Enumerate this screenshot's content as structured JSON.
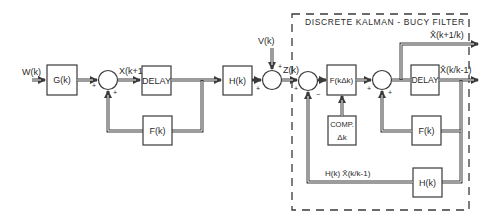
{
  "diagram": {
    "title": "DISCRETE KALMAN - BUCY FILTER",
    "colors": {
      "line": "#3a3a3a",
      "background": "#ffffff"
    },
    "plant": {
      "input_label": "W(k)",
      "G_block": "G(k)",
      "state_label": "X(k+1)",
      "delay_block": "DELAY",
      "F_block": "F(k)",
      "H_block": "H(k)",
      "noise_label": "V(k)",
      "measurement_label": "Z(k)"
    },
    "filter": {
      "gain_block": "F(kΔk)",
      "comp_block_line1": "COMP.",
      "comp_block_line2": "Δk",
      "delay_block": "DELAY",
      "F_block": "F(k)",
      "H_block": "H(k)",
      "output_predicted": "X̂(k+1/k)",
      "output_current": "X̂(k/k-1)",
      "feedback_label": "H(k) X̂(k/k-1)"
    },
    "signs": {
      "sum1_left": "+",
      "sum1_bottom": "+",
      "sum2_top": "+",
      "sum2_left": "+",
      "sum3_left": "+",
      "sum3_bottom": "−",
      "sum4_left": "+",
      "sum4_bottom": "+"
    }
  }
}
